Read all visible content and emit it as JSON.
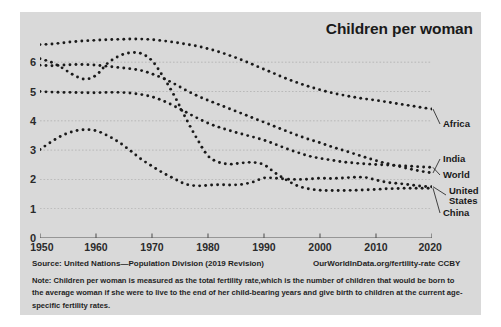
{
  "chart_data": {
    "type": "line",
    "title": "Children per woman",
    "xlabel": "",
    "ylabel": "",
    "xlim": [
      1950,
      2020
    ],
    "ylim": [
      0,
      6.6
    ],
    "grid": true,
    "legend_position": "right-inline",
    "style": "dotted",
    "xticks": [
      1950,
      1960,
      1970,
      1980,
      1990,
      2000,
      2010,
      2020
    ],
    "yticks": [
      0,
      1,
      2,
      3,
      4,
      5,
      6
    ],
    "x": [
      1950,
      1952,
      1954,
      1956,
      1958,
      1960,
      1962,
      1964,
      1966,
      1968,
      1970,
      1972,
      1974,
      1976,
      1978,
      1980,
      1982,
      1984,
      1986,
      1988,
      1990,
      1992,
      1994,
      1996,
      1998,
      2000,
      2002,
      2004,
      2006,
      2008,
      2010,
      2012,
      2014,
      2016,
      2018,
      2020
    ],
    "series": [
      {
        "name": "Africa",
        "color": "#1a1a1a",
        "values": [
          6.6,
          6.62,
          6.66,
          6.7,
          6.73,
          6.75,
          6.77,
          6.78,
          6.79,
          6.79,
          6.77,
          6.73,
          6.68,
          6.62,
          6.55,
          6.46,
          6.35,
          6.22,
          6.08,
          5.92,
          5.76,
          5.6,
          5.44,
          5.3,
          5.17,
          5.06,
          4.96,
          4.88,
          4.81,
          4.75,
          4.7,
          4.64,
          4.58,
          4.52,
          4.46,
          4.4
        ]
      },
      {
        "name": "India",
        "color": "#1a1a1a",
        "values": [
          5.9,
          5.88,
          5.9,
          5.92,
          5.92,
          5.9,
          5.86,
          5.82,
          5.78,
          5.72,
          5.6,
          5.45,
          5.26,
          5.05,
          4.86,
          4.7,
          4.55,
          4.4,
          4.25,
          4.1,
          3.95,
          3.8,
          3.65,
          3.5,
          3.37,
          3.25,
          3.12,
          3.0,
          2.88,
          2.76,
          2.64,
          2.54,
          2.45,
          2.36,
          2.28,
          2.22
        ]
      },
      {
        "name": "World",
        "color": "#1a1a1a",
        "values": [
          5.0,
          4.98,
          4.97,
          4.97,
          4.96,
          4.96,
          4.97,
          4.97,
          4.95,
          4.9,
          4.82,
          4.68,
          4.5,
          4.3,
          4.1,
          3.92,
          3.78,
          3.66,
          3.55,
          3.45,
          3.34,
          3.2,
          3.05,
          2.92,
          2.8,
          2.72,
          2.66,
          2.6,
          2.56,
          2.53,
          2.51,
          2.49,
          2.47,
          2.45,
          2.43,
          2.41
        ]
      },
      {
        "name": "United States",
        "color": "#1a1a1a",
        "values": [
          3.02,
          3.28,
          3.5,
          3.64,
          3.7,
          3.66,
          3.5,
          3.28,
          3.0,
          2.7,
          2.45,
          2.22,
          2.02,
          1.84,
          1.78,
          1.8,
          1.82,
          1.81,
          1.83,
          1.91,
          2.05,
          2.04,
          2.01,
          2.0,
          2.01,
          2.04,
          2.03,
          2.05,
          2.07,
          2.07,
          1.98,
          1.9,
          1.86,
          1.82,
          1.77,
          1.75
        ]
      },
      {
        "name": "China",
        "color": "#1a1a1a",
        "values": [
          6.12,
          6.0,
          5.8,
          5.56,
          5.42,
          5.55,
          5.95,
          6.2,
          6.32,
          6.3,
          6.05,
          5.5,
          4.85,
          4.1,
          3.4,
          2.8,
          2.58,
          2.52,
          2.56,
          2.58,
          2.5,
          2.22,
          1.98,
          1.78,
          1.68,
          1.63,
          1.62,
          1.62,
          1.63,
          1.64,
          1.66,
          1.68,
          1.69,
          1.7,
          1.7,
          1.7
        ]
      }
    ],
    "series_labels": [
      {
        "name": "Africa",
        "text": "Africa",
        "lines": [
          "Africa"
        ]
      },
      {
        "name": "India",
        "text": "India",
        "lines": [
          "India"
        ]
      },
      {
        "name": "World",
        "text": "World",
        "lines": [
          "World"
        ]
      },
      {
        "name": "United States",
        "text": "United States",
        "lines": [
          "United",
          "States"
        ]
      },
      {
        "name": "China",
        "text": "China",
        "lines": [
          "China"
        ]
      }
    ]
  },
  "footer": {
    "source": "Source: United Nations—Population Division (2019 Revision)",
    "owid": "OurWorldInData.org/fertility-rate CCBY",
    "note": "Note: Children per woman is measured as the total fertility rate,which is the number of children that would be born to the average woman if she were to live to the end of her child-bearing years and give birth to children at the current age-specific fertility rates."
  },
  "colors": {
    "panel": "#d9d9d9",
    "page": "#ffffff",
    "ink": "#1a1a1a",
    "grid": "#9a9a9a",
    "axis": "#555555"
  }
}
